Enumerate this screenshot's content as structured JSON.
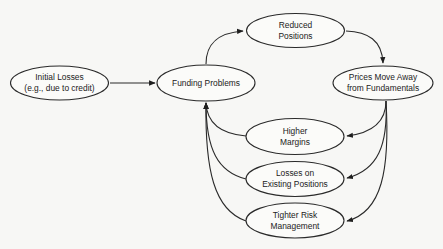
{
  "diagram": {
    "type": "flow",
    "nodes": [
      {
        "id": "initial-losses",
        "lines": [
          "Initial Losses",
          "(e.g., due to credit)"
        ]
      },
      {
        "id": "funding-problems",
        "lines": [
          "Funding Problems"
        ]
      },
      {
        "id": "reduced-positions",
        "lines": [
          "Reduced",
          "Positions"
        ]
      },
      {
        "id": "prices-move-away",
        "lines": [
          "Prices Move Away",
          "from Fundamentals"
        ]
      },
      {
        "id": "higher-margins",
        "lines": [
          "Higher",
          "Margins"
        ]
      },
      {
        "id": "losses-existing-positions",
        "lines": [
          "Losses on",
          "Existing Positions"
        ]
      },
      {
        "id": "tighter-risk-management",
        "lines": [
          "Tighter Risk",
          "Management"
        ]
      }
    ],
    "edges": [
      {
        "from": "initial-losses",
        "to": "funding-problems"
      },
      {
        "from": "funding-problems",
        "to": "reduced-positions"
      },
      {
        "from": "reduced-positions",
        "to": "prices-move-away"
      },
      {
        "from": "prices-move-away",
        "to": "higher-margins"
      },
      {
        "from": "prices-move-away",
        "to": "losses-existing-positions"
      },
      {
        "from": "prices-move-away",
        "to": "tighter-risk-management"
      },
      {
        "from": "higher-margins",
        "to": "funding-problems"
      },
      {
        "from": "losses-existing-positions",
        "to": "funding-problems"
      },
      {
        "from": "tighter-risk-management",
        "to": "funding-problems"
      }
    ]
  }
}
